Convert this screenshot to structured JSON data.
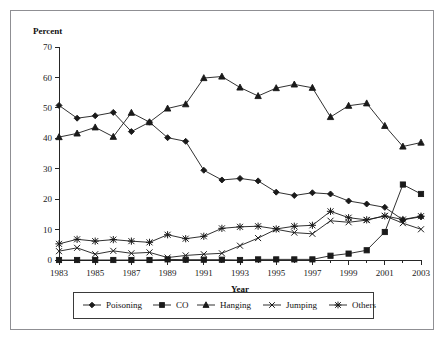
{
  "figure": {
    "ylabel_top": "Percent",
    "xlabel": "Year"
  },
  "chart_data": {
    "type": "line",
    "title": "",
    "xlabel": "Year",
    "ylabel": "Percent",
    "ylim": [
      0,
      70
    ],
    "xlim": [
      1983,
      2003
    ],
    "grid": false,
    "legend_position": "bottom",
    "ytick_labels": [
      "0",
      "10",
      "20",
      "30",
      "40",
      "50",
      "60",
      "70"
    ],
    "yticks": [
      0,
      10,
      20,
      30,
      40,
      50,
      60,
      70
    ],
    "xtick_labels": [
      "1983",
      "1985",
      "1987",
      "1989",
      "1991",
      "1993",
      "1995",
      "1997",
      "1999",
      "2001",
      "2003"
    ],
    "xticks": [
      1983,
      1985,
      1987,
      1989,
      1991,
      1993,
      1995,
      1997,
      1999,
      2001,
      2003
    ],
    "x": [
      1983,
      1984,
      1985,
      1986,
      1987,
      1988,
      1989,
      1990,
      1991,
      1992,
      1993,
      1994,
      1995,
      1996,
      1997,
      1998,
      1999,
      2000,
      2001,
      2002,
      2003
    ],
    "series": [
      {
        "name": "Poisoning",
        "marker": "diamond",
        "values": [
          50.8,
          46.6,
          47.4,
          48.5,
          42.2,
          45.3,
          40.2,
          39.0,
          29.5,
          26.3,
          26.8,
          26.0,
          22.3,
          21.2,
          22.1,
          21.7,
          19.4,
          18.4,
          17.3,
          13.2,
          14.2
        ]
      },
      {
        "name": "CO",
        "marker": "square",
        "values": [
          0.0,
          0.0,
          0.0,
          0.0,
          0.0,
          0.0,
          0.2,
          0.1,
          0.1,
          0.1,
          0.0,
          0.2,
          0.2,
          0.2,
          0.2,
          1.4,
          2.1,
          3.2,
          9.2,
          24.8,
          21.7
        ]
      },
      {
        "name": "Hanging",
        "marker": "triangle",
        "values": [
          40.4,
          41.6,
          43.6,
          40.5,
          48.4,
          45.3,
          49.8,
          51.2,
          59.8,
          60.3,
          56.7,
          53.9,
          56.5,
          57.7,
          56.6,
          47.0,
          50.7,
          51.5,
          44.1,
          37.3,
          38.6
        ]
      },
      {
        "name": "Jumping",
        "marker": "x",
        "values": [
          2.9,
          4.0,
          1.9,
          3.0,
          2.2,
          2.5,
          0.8,
          1.5,
          1.9,
          2.2,
          4.7,
          7.2,
          10.1,
          9.0,
          8.6,
          12.9,
          12.4,
          13.1,
          14.5,
          12.1,
          10.1
        ]
      },
      {
        "name": "Others",
        "marker": "asterisk",
        "values": [
          5.3,
          6.8,
          6.2,
          6.7,
          6.2,
          5.8,
          8.3,
          7.0,
          7.8,
          10.4,
          10.9,
          11.1,
          10.2,
          11.1,
          11.4,
          16.0,
          13.9,
          13.2,
          14.5,
          13.3,
          14.4
        ]
      }
    ]
  },
  "legend": {
    "items": [
      {
        "label": "Poisoning",
        "marker": "diamond"
      },
      {
        "label": "CO",
        "marker": "square"
      },
      {
        "label": "Hanging",
        "marker": "triangle"
      },
      {
        "label": "Jumping",
        "marker": "x"
      },
      {
        "label": "Others",
        "marker": "asterisk"
      }
    ]
  }
}
